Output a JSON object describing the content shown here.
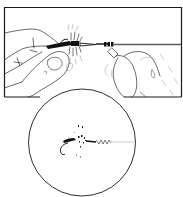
{
  "figure": {
    "type": "line-illustration",
    "colors": {
      "background": "#ffffff",
      "ink": "#1a1a1a",
      "light_ink": "#8a8a8a"
    },
    "panels": [
      {
        "id": "top-panel",
        "content": "two hands pinching fly and leader line, knot being tightened"
      },
      {
        "id": "inset-circle",
        "content": "close-up of tied fly with knot on tippet"
      }
    ]
  }
}
